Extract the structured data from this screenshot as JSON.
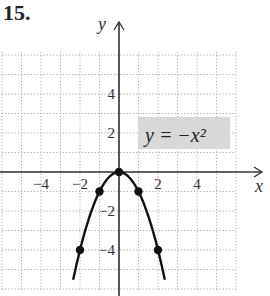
{
  "problem_label": "15.",
  "chart_data": {
    "type": "line",
    "title": "",
    "equation_label": "y = −x²",
    "xlabel": "x",
    "ylabel": "y",
    "xlim": [
      -6,
      6
    ],
    "ylim": [
      -6,
      6
    ],
    "grid": true,
    "x_ticks": [
      -4,
      -2,
      2,
      4
    ],
    "x_tick_labels": [
      "−4",
      "−2",
      "2",
      "4"
    ],
    "y_ticks": [
      4,
      2,
      -2,
      -4
    ],
    "y_tick_labels": [
      "4",
      "2",
      "−2",
      "−4"
    ],
    "series": [
      {
        "name": "y = -x^2",
        "function": "-x^2",
        "x_range": [
          -2.35,
          2.35
        ]
      }
    ],
    "points": [
      {
        "x": -2,
        "y": -4
      },
      {
        "x": -1,
        "y": -1
      },
      {
        "x": 0,
        "y": 0
      },
      {
        "x": 1,
        "y": -1
      },
      {
        "x": 2,
        "y": -4
      }
    ],
    "colors": {
      "curve": "#111111",
      "grid": "#aaaaaa",
      "label_box": "#d8d8d8"
    }
  }
}
